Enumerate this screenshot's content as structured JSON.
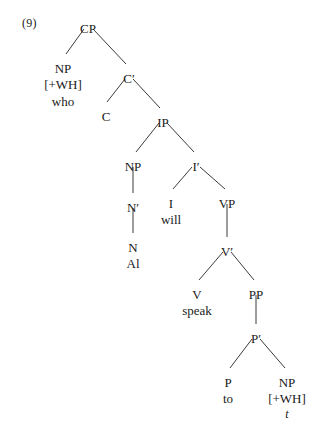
{
  "example": {
    "number_label": "(9)"
  },
  "tree": {
    "type": "syntax-tree",
    "sentence": "who will Al speak to t",
    "nodes": [
      {
        "id": "CP",
        "label": "CP",
        "x": 88,
        "y": 22,
        "feature": null,
        "word": null,
        "trace": null
      },
      {
        "id": "NP1",
        "label": "NP",
        "x": 63,
        "y": 62,
        "feature": "[+WH]",
        "word": "who",
        "trace": null
      },
      {
        "id": "Cbar",
        "label": "C′",
        "x": 129,
        "y": 72,
        "feature": null,
        "word": null,
        "trace": null
      },
      {
        "id": "C",
        "label": "C",
        "x": 106,
        "y": 110,
        "feature": null,
        "word": null,
        "trace": null
      },
      {
        "id": "IP",
        "label": "IP",
        "x": 163,
        "y": 116,
        "feature": null,
        "word": null,
        "trace": null
      },
      {
        "id": "NP2",
        "label": "NP",
        "x": 133,
        "y": 160,
        "feature": null,
        "word": null,
        "trace": null
      },
      {
        "id": "Ibar",
        "label": "I′",
        "x": 196,
        "y": 160,
        "feature": null,
        "word": null,
        "trace": null
      },
      {
        "id": "Nbar",
        "label": "N′",
        "x": 133,
        "y": 201,
        "feature": null,
        "word": null,
        "trace": null
      },
      {
        "id": "I",
        "label": "I",
        "x": 171,
        "y": 197,
        "feature": null,
        "word": "will",
        "trace": null
      },
      {
        "id": "VP",
        "label": "VP",
        "x": 227,
        "y": 197,
        "feature": null,
        "word": null,
        "trace": null
      },
      {
        "id": "N",
        "label": "N",
        "x": 133,
        "y": 241,
        "feature": null,
        "word": "Al",
        "trace": null
      },
      {
        "id": "Vbar",
        "label": "V′",
        "x": 227,
        "y": 245,
        "feature": null,
        "word": null,
        "trace": null
      },
      {
        "id": "V",
        "label": "V",
        "x": 197,
        "y": 288,
        "feature": null,
        "word": "speak",
        "trace": null
      },
      {
        "id": "PP",
        "label": "PP",
        "x": 256,
        "y": 288,
        "feature": null,
        "word": null,
        "trace": null
      },
      {
        "id": "Pbar",
        "label": "P′",
        "x": 256,
        "y": 332,
        "feature": null,
        "word": null,
        "trace": null
      },
      {
        "id": "P",
        "label": "P",
        "x": 228,
        "y": 376,
        "feature": null,
        "word": "to",
        "trace": null
      },
      {
        "id": "NP3",
        "label": "NP",
        "x": 287,
        "y": 376,
        "feature": "[+WH]",
        "word": null,
        "trace": "t"
      }
    ],
    "edges": [
      {
        "from": "CP",
        "to": "NP1",
        "x1": 84,
        "y1": 29,
        "x2": 66,
        "y2": 54
      },
      {
        "from": "CP",
        "to": "Cbar",
        "x1": 93,
        "y1": 29,
        "x2": 126,
        "y2": 64
      },
      {
        "from": "Cbar",
        "to": "C",
        "x1": 125,
        "y1": 79,
        "x2": 107,
        "y2": 102
      },
      {
        "from": "Cbar",
        "to": "IP",
        "x1": 133,
        "y1": 79,
        "x2": 160,
        "y2": 108
      },
      {
        "from": "IP",
        "to": "NP2",
        "x1": 159,
        "y1": 123,
        "x2": 136,
        "y2": 152
      },
      {
        "from": "IP",
        "to": "Ibar",
        "x1": 167,
        "y1": 123,
        "x2": 194,
        "y2": 152
      },
      {
        "from": "NP2",
        "to": "Nbar",
        "x1": 133,
        "y1": 167,
        "x2": 133,
        "y2": 193
      },
      {
        "from": "Ibar",
        "to": "I",
        "x1": 192,
        "y1": 167,
        "x2": 173,
        "y2": 189
      },
      {
        "from": "Ibar",
        "to": "VP",
        "x1": 200,
        "y1": 167,
        "x2": 225,
        "y2": 189
      },
      {
        "from": "Nbar",
        "to": "N",
        "x1": 133,
        "y1": 208,
        "x2": 133,
        "y2": 233
      },
      {
        "from": "VP",
        "to": "Vbar",
        "x1": 227,
        "y1": 204,
        "x2": 227,
        "y2": 237
      },
      {
        "from": "Vbar",
        "to": "V",
        "x1": 223,
        "y1": 252,
        "x2": 199,
        "y2": 280
      },
      {
        "from": "Vbar",
        "to": "PP",
        "x1": 231,
        "y1": 252,
        "x2": 254,
        "y2": 280
      },
      {
        "from": "PP",
        "to": "Pbar",
        "x1": 256,
        "y1": 295,
        "x2": 256,
        "y2": 324
      },
      {
        "from": "Pbar",
        "to": "P",
        "x1": 252,
        "y1": 339,
        "x2": 230,
        "y2": 368
      },
      {
        "from": "Pbar",
        "to": "NP3",
        "x1": 260,
        "y1": 339,
        "x2": 285,
        "y2": 368
      }
    ]
  }
}
